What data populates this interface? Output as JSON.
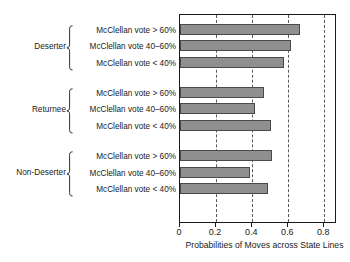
{
  "chart_data": {
    "type": "bar",
    "orientation": "horizontal",
    "title": "",
    "xlabel": "Probabilities of Moves across State Lines",
    "ylabel": "",
    "xlim": [
      0,
      0.87
    ],
    "xticks": [
      0,
      0.2,
      0.4,
      0.6,
      0.8
    ],
    "xticklabels": [
      "0",
      "0.2",
      "0.4",
      "0.6",
      "0.8"
    ],
    "grid": "vertical-dashed",
    "legend": "none",
    "bar_color": "#8f8f8f",
    "bar_edge_color": "#4a4a4a",
    "categories": [
      "McClellan vote > 60%",
      "McClellan vote 40–60%",
      "McClellan vote < 40%"
    ],
    "groups": [
      {
        "name": "Deserter",
        "bars": [
          {
            "label": "McClellan vote > 60%",
            "value": 0.665
          },
          {
            "label": "McClellan vote 40–60%",
            "value": 0.615
          },
          {
            "label": "McClellan vote < 40%",
            "value": 0.578
          }
        ]
      },
      {
        "name": "Returnee",
        "bars": [
          {
            "label": "McClellan vote > 60%",
            "value": 0.463
          },
          {
            "label": "McClellan vote 40–60%",
            "value": 0.415
          },
          {
            "label": "McClellan vote < 40%",
            "value": 0.507
          }
        ]
      },
      {
        "name": "Non-Deserter",
        "bars": [
          {
            "label": "McClellan vote > 60%",
            "value": 0.512
          },
          {
            "label": "McClellan vote 40–60%",
            "value": 0.388
          },
          {
            "label": "McClellan vote < 40%",
            "value": 0.487
          }
        ]
      }
    ]
  }
}
